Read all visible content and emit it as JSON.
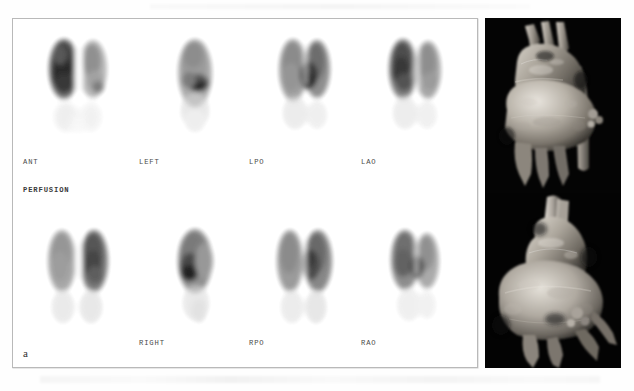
{
  "figure": {
    "panel_a_tag": "a",
    "panel_b_tag": "b",
    "modality_label": "PERFUSION"
  },
  "panel_a": {
    "title": "PERFUSION",
    "rows": [
      {
        "name": "upper-row",
        "views": [
          {
            "label": "ANT",
            "description": "anterior lung perfusion scintigram, reduced uptake in left lung"
          },
          {
            "label": "LEFT",
            "description": "left lateral lung perfusion scintigram"
          },
          {
            "label": "LPO",
            "description": "left posterior oblique lung perfusion scintigram"
          },
          {
            "label": "LAO",
            "description": "left anterior oblique lung perfusion scintigram"
          }
        ]
      },
      {
        "name": "lower-row",
        "views": [
          {
            "label": "",
            "description": "posterior lung perfusion scintigram, unlabeled"
          },
          {
            "label": "RIGHT",
            "description": "right lateral lung perfusion scintigram"
          },
          {
            "label": "RPO",
            "description": "right posterior oblique lung perfusion scintigram"
          },
          {
            "label": "RAO",
            "description": "right anterior oblique lung perfusion scintigram"
          }
        ]
      }
    ]
  },
  "panel_b": {
    "tag": "b",
    "images": [
      {
        "name": "ct-3d-upper",
        "description": "3D volume-rendered CT angiogram of aortic arch with great vessels, upper view"
      },
      {
        "name": "ct-3d-lower",
        "description": "3D volume-rendered CT angiogram of aortic arch, lower/rotated view"
      }
    ]
  },
  "colors": {
    "page_background": "#ffffff",
    "panel_a_background": "#ffffff",
    "panel_a_border": "#b9b9b9",
    "panel_b_background": "#000000",
    "label_text": "#4a4a4a",
    "tag_text_dark": "#2d2d2d",
    "tag_text_light": "#f2f2f2"
  }
}
